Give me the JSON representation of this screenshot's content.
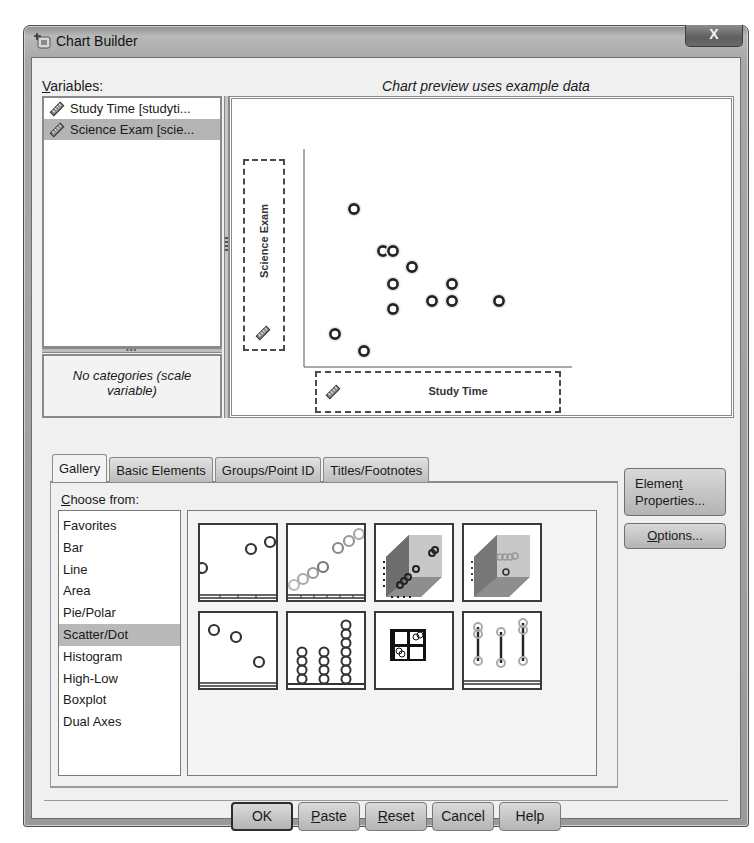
{
  "window": {
    "title": "Chart Builder",
    "close_label": "X"
  },
  "variables": {
    "label_prefix": "",
    "label_mnemonic": "V",
    "label_rest": "ariables:",
    "items": [
      {
        "label": "Study Time [studyti...",
        "icon": "scale-ruler-icon",
        "selected": false
      },
      {
        "label": "Science Exam [scie...",
        "icon": "scale-ruler-icon",
        "selected": true
      }
    ],
    "categories_note": "No categories (scale variable)"
  },
  "preview": {
    "caption": "Chart preview uses example data",
    "y_axis_label": "Science Exam",
    "x_axis_label": "Study Time"
  },
  "chart_data": {
    "type": "scatter",
    "title": "",
    "xlabel": "Study Time",
    "ylabel": "Science Exam",
    "grid": false,
    "note": "Example preview data; axes unlabeled, positions in canvas pixel coordinates relative to plot origin (x right, y up)",
    "points": [
      {
        "x": 50,
        "y": 158
      },
      {
        "x": 79,
        "y": 116
      },
      {
        "x": 89,
        "y": 116
      },
      {
        "x": 108,
        "y": 100
      },
      {
        "x": 89,
        "y": 83
      },
      {
        "x": 148,
        "y": 83
      },
      {
        "x": 128,
        "y": 66
      },
      {
        "x": 148,
        "y": 66
      },
      {
        "x": 195,
        "y": 66
      },
      {
        "x": 89,
        "y": 58
      },
      {
        "x": 31,
        "y": 33
      },
      {
        "x": 60,
        "y": 16
      }
    ]
  },
  "tabs": [
    {
      "label": "Gallery",
      "active": true
    },
    {
      "label": "Basic Elements",
      "active": false
    },
    {
      "label": "Groups/Point ID",
      "active": false
    },
    {
      "label": "Titles/Footnotes",
      "active": false
    }
  ],
  "gallery": {
    "choose_mnemonic": "C",
    "choose_rest": "hoose from:",
    "chart_types": [
      {
        "label": "Favorites",
        "selected": false
      },
      {
        "label": "Bar",
        "selected": false
      },
      {
        "label": "Line",
        "selected": false
      },
      {
        "label": "Area",
        "selected": false
      },
      {
        "label": "Pie/Polar",
        "selected": false
      },
      {
        "label": "Scatter/Dot",
        "selected": true
      },
      {
        "label": "Histogram",
        "selected": false
      },
      {
        "label": "High-Low",
        "selected": false
      },
      {
        "label": "Boxplot",
        "selected": false
      },
      {
        "label": "Dual Axes",
        "selected": false
      }
    ],
    "thumbnails": [
      {
        "name": "simple-scatter"
      },
      {
        "name": "grouped-scatter"
      },
      {
        "name": "simple-3d-scatter"
      },
      {
        "name": "grouped-3d-scatter"
      },
      {
        "name": "summary-point-plot"
      },
      {
        "name": "simple-dot-plot"
      },
      {
        "name": "scatterplot-matrix"
      },
      {
        "name": "drop-line"
      }
    ]
  },
  "side_buttons": {
    "element_properties_line1_pre": "Elemen",
    "element_properties_line1_mn": "t",
    "element_properties_line2": "Properties...",
    "options_mn": "O",
    "options_rest": "ptions..."
  },
  "dialog_buttons": {
    "ok": "OK",
    "paste_mn": "P",
    "paste_rest": "aste",
    "reset_mn": "R",
    "reset_rest": "eset",
    "cancel": "Cancel",
    "help": "Help"
  }
}
